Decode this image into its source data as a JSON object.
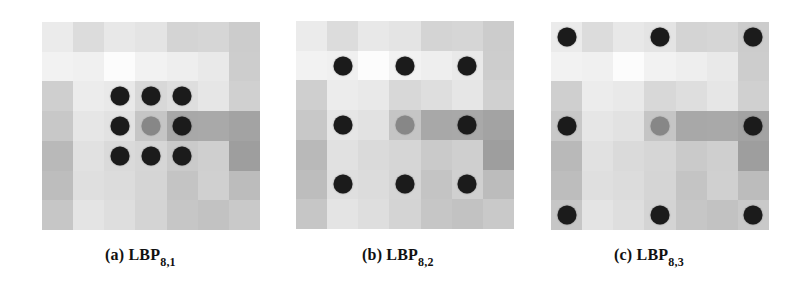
{
  "figure": {
    "grid_size": 7,
    "cell_colors": [
      [
        "#ebebeb",
        "#dcdcdc",
        "#e8e8e8",
        "#e4e4e4",
        "#d4d4d4",
        "#d6d6d6",
        "#cccccc"
      ],
      [
        "#f2f2f2",
        "#f0f0f0",
        "#fcfcfc",
        "#f2f2f2",
        "#eeeeee",
        "#e9e9e9",
        "#cdcdcd"
      ],
      [
        "#cfcfcf",
        "#ececec",
        "#e9e9e9",
        "#d8d8d8",
        "#dedede",
        "#e6e6e6",
        "#d0d0d0"
      ],
      [
        "#c8c8c8",
        "#e6e6e6",
        "#e2e2e2",
        "#c5c5c5",
        "#a8a8a8",
        "#a9a9a9",
        "#a3a3a3"
      ],
      [
        "#b9b9b9",
        "#e1e1e1",
        "#dadada",
        "#d6d6d6",
        "#cacaca",
        "#cfcfcf",
        "#9e9e9e"
      ],
      [
        "#bdbdbd",
        "#dfdfdf",
        "#dcdcdc",
        "#d5d5d5",
        "#c4c4c4",
        "#d0d0d0",
        "#bcbcbc"
      ],
      [
        "#c6c6c6",
        "#e4e4e4",
        "#dedede",
        "#d4d4d4",
        "#c6c6c6",
        "#c2c2c2",
        "#c9c9c9"
      ]
    ],
    "neighbor_dot_color": "#1b1b1b",
    "center_dot_color": "#878787",
    "panels": [
      {
        "id": "a",
        "label": "(a) LBP",
        "subscript": "8,1",
        "points": 8,
        "radius": 1,
        "grid_left": 42,
        "grid_top": 22,
        "caption_left": 105,
        "neighbor_offsets": [
          [
            -1,
            -1
          ],
          [
            0,
            -1
          ],
          [
            1,
            -1
          ],
          [
            -1,
            0
          ],
          [
            1,
            0
          ],
          [
            -1,
            1
          ],
          [
            0,
            1
          ],
          [
            1,
            1
          ]
        ]
      },
      {
        "id": "b",
        "label": "(b) LBP",
        "subscript": "8,2",
        "points": 8,
        "radius": 2,
        "grid_left": 296,
        "grid_top": 21,
        "caption_left": 362,
        "neighbor_offsets": [
          [
            -2,
            -2
          ],
          [
            0,
            -2
          ],
          [
            2,
            -2
          ],
          [
            -2,
            0
          ],
          [
            2,
            0
          ],
          [
            -2,
            2
          ],
          [
            0,
            2
          ],
          [
            2,
            2
          ]
        ]
      },
      {
        "id": "c",
        "label": "(c) LBP",
        "subscript": "8,3",
        "points": 8,
        "radius": 3,
        "grid_left": 551,
        "grid_top": 22,
        "caption_left": 614,
        "neighbor_offsets": [
          [
            -3,
            -3
          ],
          [
            0,
            -3
          ],
          [
            3,
            -3
          ],
          [
            -3,
            0
          ],
          [
            3,
            0
          ],
          [
            -3,
            3
          ],
          [
            0,
            3
          ],
          [
            3,
            3
          ]
        ]
      }
    ]
  }
}
